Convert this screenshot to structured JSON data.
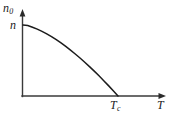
{
  "figure": {
    "name": "bec-condensate-fraction-plot",
    "background_color": "#ffffff",
    "line_color": "#1c1c1c",
    "axis_color": "#3a3a3a"
  },
  "labels": {
    "y_axis_symbol": "n",
    "y_axis_subscript": "0",
    "y_value_symbol": "n",
    "x_axis_symbol": "T",
    "x_critical_symbol": "T",
    "x_critical_subscript": "c"
  },
  "chart_data": {
    "type": "line",
    "title": "",
    "xlabel": "T",
    "ylabel": "n0",
    "xlim": [
      0,
      1.35
    ],
    "ylim": [
      0,
      1.18
    ],
    "grid": false,
    "legend": null,
    "annotations": [
      {
        "text": "n",
        "axis": "y",
        "value": 1.0,
        "meaning": "total-density-at-zero-temperature"
      },
      {
        "text": "Tc",
        "axis": "x",
        "value": 1.0,
        "meaning": "critical-temperature"
      }
    ],
    "series": [
      {
        "name": "condensate-fraction",
        "x": [
          0.0,
          0.05,
          0.1,
          0.15,
          0.2,
          0.25,
          0.3,
          0.35,
          0.4,
          0.45,
          0.5,
          0.55,
          0.6,
          0.65,
          0.7,
          0.75,
          0.8,
          0.85,
          0.9,
          0.95,
          1.0
        ],
        "y": [
          1.0,
          0.994,
          0.968,
          0.942,
          0.911,
          0.875,
          0.836,
          0.793,
          0.747,
          0.698,
          0.646,
          0.592,
          0.535,
          0.476,
          0.414,
          0.35,
          0.284,
          0.216,
          0.146,
          0.074,
          0.0
        ]
      }
    ]
  }
}
